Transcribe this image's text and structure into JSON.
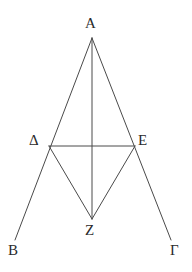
{
  "figure": {
    "background_color": "#ffffff",
    "line_color": "#4a4a4a",
    "label_color": "#2b2b2b",
    "canvas": {
      "width": 192,
      "height": 272
    },
    "points": {
      "A": {
        "label": "A",
        "x": 92,
        "y": 38
      },
      "Delta": {
        "label": "Δ",
        "x": 49,
        "y": 146
      },
      "E": {
        "label": "E",
        "x": 135,
        "y": 146
      },
      "Z": {
        "label": "Z",
        "x": 92,
        "y": 219
      },
      "B": {
        "label": "B",
        "x": 15,
        "y": 240
      },
      "Gamma": {
        "label": "Γ",
        "x": 171,
        "y": 240
      }
    },
    "segments": [
      {
        "name": "A-to-B-ray",
        "from": "A",
        "to": "B"
      },
      {
        "name": "A-to-Gamma-ray",
        "from": "A",
        "to": "Gamma"
      },
      {
        "name": "A-to-Z-vertical",
        "from": "A",
        "to": "Z"
      },
      {
        "name": "Delta-to-E-base",
        "from": "Delta",
        "to": "E"
      },
      {
        "name": "Delta-to-Z",
        "from": "Delta",
        "to": "Z"
      },
      {
        "name": "E-to-Z",
        "from": "E",
        "to": "Z"
      }
    ]
  }
}
